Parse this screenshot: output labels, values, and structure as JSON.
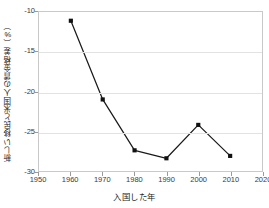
{
  "chart_data": {
    "type": "line",
    "title": "",
    "xlabel": "入国した年",
    "ylabel": "新しい移民と米国人の賃金格差（%）",
    "x": [
      1960,
      1970,
      1980,
      1990,
      2000,
      2010
    ],
    "values": [
      -11.1,
      -21.0,
      -27.4,
      -28.4,
      -24.2,
      -28.1
    ],
    "series": [
      {
        "name": "新しい移民と米国人の賃金格差",
        "x": [
          1960,
          1970,
          1980,
          1990,
          2000,
          2010
        ],
        "values": [
          -11.1,
          -21.0,
          -27.4,
          -28.4,
          -24.2,
          -28.1
        ]
      }
    ],
    "xlim": [
      1950,
      2020
    ],
    "ylim": [
      -30,
      -10
    ],
    "xticks": [
      1950,
      1960,
      1970,
      1980,
      1990,
      2000,
      2010,
      2020
    ],
    "xtick_labels": [
      "1950",
      "1960",
      "1970",
      "1980",
      "1990",
      "2000",
      "2010",
      "2020"
    ],
    "yticks": [
      -10,
      -15,
      -20,
      -25,
      -30
    ],
    "ytick_labels": [
      "-10",
      "-15",
      "-20",
      "-25",
      "-30"
    ],
    "grid": "horizontal",
    "legend": "none",
    "marker": "square",
    "line_color": "#1a1a1a",
    "marker_color": "#111111",
    "grid_color": "#e2e2e2",
    "frame_color": "#c9c9c9",
    "background": "#ffffff"
  }
}
